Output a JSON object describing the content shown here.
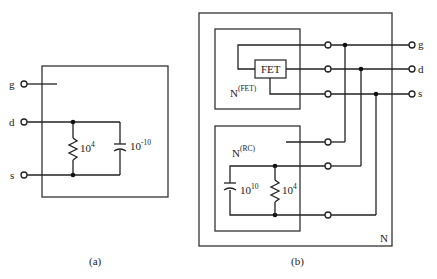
{
  "figure": {
    "subfigures": [
      {
        "id": "a",
        "caption": "(a)",
        "terminals": [
          "g",
          "d",
          "s"
        ],
        "resistor": {
          "base": "10",
          "exp": "4"
        },
        "capacitor": {
          "base": "10",
          "exp": "-10"
        }
      },
      {
        "id": "b",
        "caption": "(b)",
        "outer_network_label": "N",
        "fet_network": {
          "label_base": "N",
          "label_sup": "(FET)",
          "device": "FET"
        },
        "rc_network": {
          "label_base": "N",
          "label_sup": "(RC)",
          "capacitor": {
            "base": "10",
            "exp": "10"
          },
          "resistor": {
            "base": "10",
            "exp": "4"
          }
        },
        "terminals": [
          "g",
          "d",
          "s"
        ]
      }
    ]
  }
}
